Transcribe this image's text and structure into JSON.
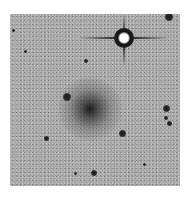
{
  "image": {
    "description": "Inverted (negative) grayscale astronomical field showing a diffuse galaxy near center and a bright star with diffraction spikes at upper right",
    "background_color": "#a9a9a9",
    "objects": [
      {
        "type": "galaxy",
        "label": "diffuse-galaxy",
        "cx": 92,
        "cy": 101,
        "r": 24
      },
      {
        "type": "bright-star",
        "label": "bright-star-with-spikes",
        "cx": 124,
        "cy": 38,
        "r": 7
      },
      {
        "type": "star",
        "cx": 169,
        "cy": 17,
        "r": 3.5
      },
      {
        "type": "star",
        "cx": 67,
        "cy": 97,
        "r": 3.5
      },
      {
        "type": "star",
        "cx": 86,
        "cy": 61,
        "r": 2
      },
      {
        "type": "star",
        "cx": 166,
        "cy": 108,
        "r": 3
      },
      {
        "type": "star",
        "cx": 166,
        "cy": 118,
        "r": 2
      },
      {
        "type": "star",
        "cx": 170,
        "cy": 124,
        "r": 2.5
      },
      {
        "type": "star",
        "cx": 122,
        "cy": 133,
        "r": 3
      },
      {
        "type": "star",
        "cx": 46,
        "cy": 138,
        "r": 2.2
      },
      {
        "type": "star",
        "cx": 94,
        "cy": 173,
        "r": 2.8
      },
      {
        "type": "star",
        "cx": 25,
        "cy": 51,
        "r": 1.3
      },
      {
        "type": "star",
        "cx": 13,
        "cy": 30,
        "r": 1.3
      },
      {
        "type": "star",
        "cx": 144,
        "cy": 164,
        "r": 1.2
      },
      {
        "type": "star",
        "cx": 75,
        "cy": 173,
        "r": 1.2
      }
    ]
  }
}
